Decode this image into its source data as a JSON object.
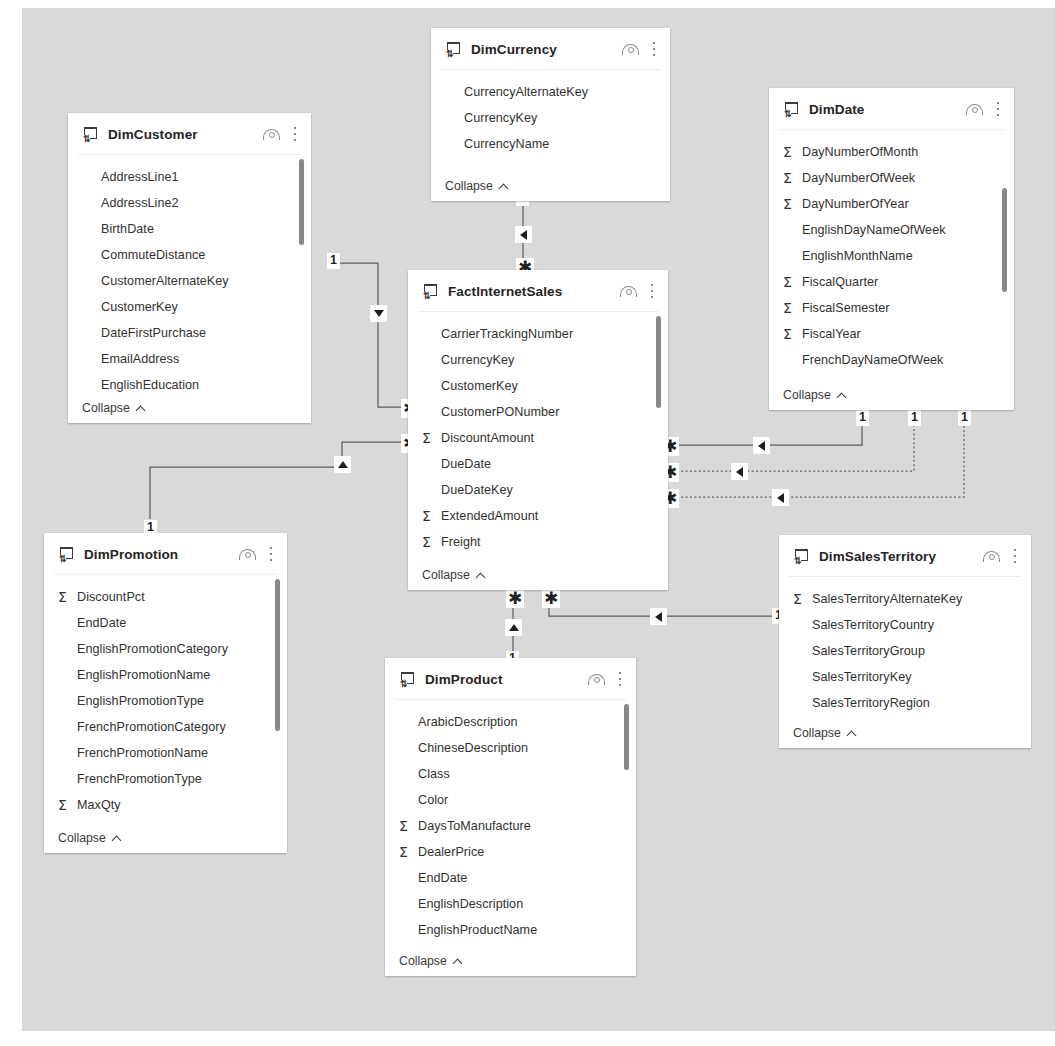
{
  "diagram": {
    "canvas_color": "#d9d9d9",
    "card_color": "#ffffff",
    "line_color": "#605e5c",
    "collapse_label": "Collapse",
    "icons": {
      "table": "table-icon",
      "visibility": "eye-icon",
      "more": "more-options-icon",
      "measure": "sigma-icon",
      "collapse": "chevron-up-icon"
    }
  },
  "tables": [
    {
      "name": "DimCurrency",
      "fields": [
        {
          "label": "CurrencyAlternateKey",
          "numeric": false
        },
        {
          "label": "CurrencyKey",
          "numeric": false
        },
        {
          "label": "CurrencyName",
          "numeric": false
        }
      ],
      "has_scrollbar": false
    },
    {
      "name": "DimCustomer",
      "fields": [
        {
          "label": "AddressLine1",
          "numeric": false
        },
        {
          "label": "AddressLine2",
          "numeric": false
        },
        {
          "label": "BirthDate",
          "numeric": false
        },
        {
          "label": "CommuteDistance",
          "numeric": false
        },
        {
          "label": "CustomerAlternateKey",
          "numeric": false
        },
        {
          "label": "CustomerKey",
          "numeric": false
        },
        {
          "label": "DateFirstPurchase",
          "numeric": false
        },
        {
          "label": "EmailAddress",
          "numeric": false
        },
        {
          "label": "EnglishEducation",
          "numeric": false
        }
      ],
      "has_scrollbar": true
    },
    {
      "name": "DimDate",
      "fields": [
        {
          "label": "DayNumberOfMonth",
          "numeric": true
        },
        {
          "label": "DayNumberOfWeek",
          "numeric": true
        },
        {
          "label": "DayNumberOfYear",
          "numeric": true
        },
        {
          "label": "EnglishDayNameOfWeek",
          "numeric": false
        },
        {
          "label": "EnglishMonthName",
          "numeric": false
        },
        {
          "label": "FiscalQuarter",
          "numeric": true
        },
        {
          "label": "FiscalSemester",
          "numeric": true
        },
        {
          "label": "FiscalYear",
          "numeric": true
        },
        {
          "label": "FrenchDayNameOfWeek",
          "numeric": false
        }
      ],
      "has_scrollbar": true
    },
    {
      "name": "FactInternetSales",
      "fields": [
        {
          "label": "CarrierTrackingNumber",
          "numeric": false
        },
        {
          "label": "CurrencyKey",
          "numeric": false
        },
        {
          "label": "CustomerKey",
          "numeric": false
        },
        {
          "label": "CustomerPONumber",
          "numeric": false
        },
        {
          "label": "DiscountAmount",
          "numeric": true
        },
        {
          "label": "DueDate",
          "numeric": false
        },
        {
          "label": "DueDateKey",
          "numeric": false
        },
        {
          "label": "ExtendedAmount",
          "numeric": true
        },
        {
          "label": "Freight",
          "numeric": true
        }
      ],
      "has_scrollbar": true
    },
    {
      "name": "DimPromotion",
      "fields": [
        {
          "label": "DiscountPct",
          "numeric": true
        },
        {
          "label": "EndDate",
          "numeric": false
        },
        {
          "label": "EnglishPromotionCategory",
          "numeric": false
        },
        {
          "label": "EnglishPromotionName",
          "numeric": false
        },
        {
          "label": "EnglishPromotionType",
          "numeric": false
        },
        {
          "label": "FrenchPromotionCategory",
          "numeric": false
        },
        {
          "label": "FrenchPromotionName",
          "numeric": false
        },
        {
          "label": "FrenchPromotionType",
          "numeric": false
        },
        {
          "label": "MaxQty",
          "numeric": true
        },
        {
          "label": "MinQty",
          "numeric": true
        }
      ],
      "has_scrollbar": true
    },
    {
      "name": "DimProduct",
      "fields": [
        {
          "label": "ArabicDescription",
          "numeric": false
        },
        {
          "label": "ChineseDescription",
          "numeric": false
        },
        {
          "label": "Class",
          "numeric": false
        },
        {
          "label": "Color",
          "numeric": false
        },
        {
          "label": "DaysToManufacture",
          "numeric": true
        },
        {
          "label": "DealerPrice",
          "numeric": true
        },
        {
          "label": "EndDate",
          "numeric": false
        },
        {
          "label": "EnglishDescription",
          "numeric": false
        },
        {
          "label": "EnglishProductName",
          "numeric": false
        }
      ],
      "has_scrollbar": true
    },
    {
      "name": "DimSalesTerritory",
      "fields": [
        {
          "label": "SalesTerritoryAlternateKey",
          "numeric": true
        },
        {
          "label": "SalesTerritoryCountry",
          "numeric": false
        },
        {
          "label": "SalesTerritoryGroup",
          "numeric": false
        },
        {
          "label": "SalesTerritoryKey",
          "numeric": false
        },
        {
          "label": "SalesTerritoryRegion",
          "numeric": false
        }
      ],
      "has_scrollbar": false
    }
  ],
  "relationships": [
    {
      "from": "DimCurrency",
      "to": "FactInternetSales",
      "from_cardinality": "1",
      "to_cardinality": "*",
      "active": true,
      "direction": "single"
    },
    {
      "from": "DimCustomer",
      "to": "FactInternetSales",
      "from_cardinality": "1",
      "to_cardinality": "*",
      "active": true,
      "direction": "both"
    },
    {
      "from": "DimPromotion",
      "to": "FactInternetSales",
      "from_cardinality": "1",
      "to_cardinality": "*",
      "active": true,
      "direction": "both"
    },
    {
      "from": "DimDate",
      "to": "FactInternetSales",
      "from_cardinality": "1",
      "to_cardinality": "*",
      "active": true,
      "direction": "single"
    },
    {
      "from": "DimDate",
      "to": "FactInternetSales",
      "from_cardinality": "1",
      "to_cardinality": "*",
      "active": false,
      "direction": "single"
    },
    {
      "from": "DimDate",
      "to": "FactInternetSales",
      "from_cardinality": "1",
      "to_cardinality": "*",
      "active": false,
      "direction": "single"
    },
    {
      "from": "DimProduct",
      "to": "FactInternetSales",
      "from_cardinality": "1",
      "to_cardinality": "*",
      "active": true,
      "direction": "both"
    },
    {
      "from": "DimSalesTerritory",
      "to": "FactInternetSales",
      "from_cardinality": "1",
      "to_cardinality": "*",
      "active": true,
      "direction": "single"
    }
  ],
  "cardinality_markers": {
    "one": "1",
    "many": "✱"
  }
}
